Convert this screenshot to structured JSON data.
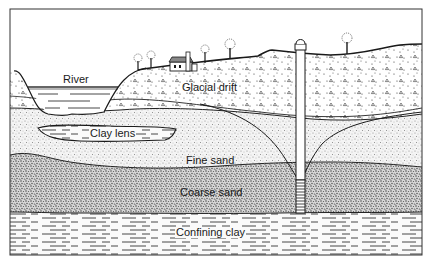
{
  "diagram": {
    "type": "geologic-cross-section",
    "labels": {
      "river": "River",
      "glacial_drift": "Glacial drift",
      "clay_lens": "Clay lens",
      "fine_sand": "Fine sand",
      "coarse_sand": "Coarse sand",
      "confining_clay": "Confining clay"
    },
    "layers": [
      {
        "name": "Glacial drift",
        "pattern": "dots-and-triangles"
      },
      {
        "name": "Fine sand",
        "pattern": "fine-stipple"
      },
      {
        "name": "Clay lens",
        "pattern": "dashes",
        "enclosed_in": "Fine sand"
      },
      {
        "name": "Coarse sand",
        "pattern": "dense-stipple"
      },
      {
        "name": "Confining clay",
        "pattern": "dashes"
      }
    ],
    "features": [
      "river",
      "house",
      "trees",
      "well",
      "well-screen",
      "cone-of-depression"
    ],
    "colors": {
      "ink": "#1a1a1a",
      "paper": "#ffffff"
    }
  }
}
